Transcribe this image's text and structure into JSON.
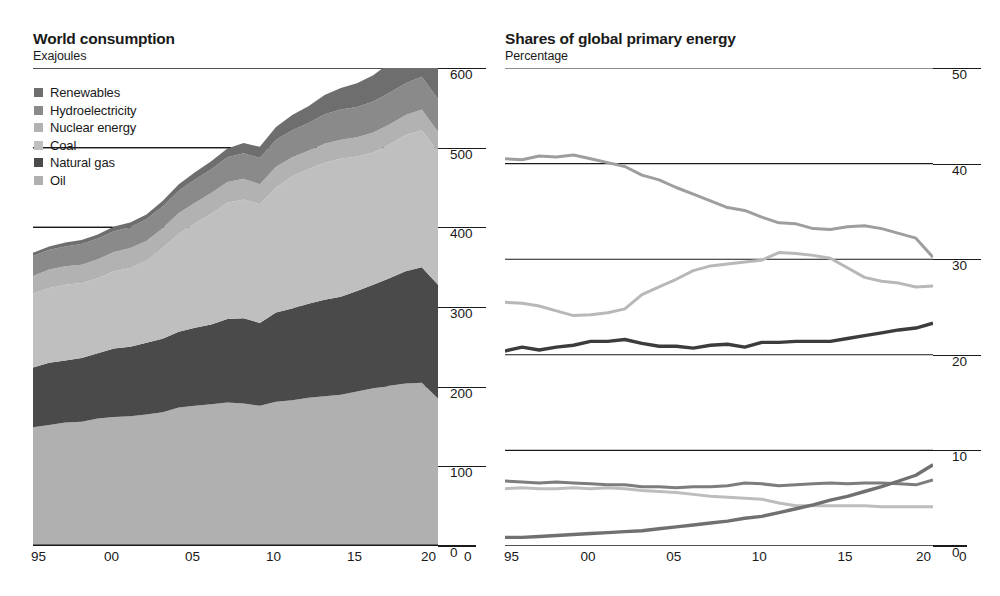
{
  "left_panel": {
    "title": "World consumption",
    "subtitle": "Exajoules",
    "legend": [
      {
        "label": "Renewables",
        "color": "#6e6e6e"
      },
      {
        "label": "Hydroelectricity",
        "color": "#8a8a8a"
      },
      {
        "label": "Nuclear energy",
        "color": "#b2b2b2"
      },
      {
        "label": "Coal",
        "color": "#bfbfbf"
      },
      {
        "label": "Natural gas",
        "color": "#4a4a4a"
      },
      {
        "label": "Oil",
        "color": "#b0b0b0"
      }
    ]
  },
  "right_panel": {
    "title": "Shares of global primary energy",
    "subtitle": "Percentage",
    "legend_col1": [
      {
        "label": "Oil",
        "color": "#b0b0b0"
      },
      {
        "label": "Coal",
        "color": "#c4c4c4"
      },
      {
        "label": "Natural gas",
        "color": "#3c3c3c"
      }
    ],
    "legend_col2": [
      {
        "label": "Hydroelectricity",
        "color": "#8a8a8a"
      },
      {
        "label": "Nuclear energy",
        "color": "#bdbdbd"
      },
      {
        "label": "Renewables",
        "color": "#6e6e6e"
      }
    ]
  },
  "chart_data": [
    {
      "id": "world-consumption",
      "type": "area",
      "title": "World consumption",
      "subtitle": "Exajoules",
      "xlabel": "",
      "ylabel": "Exajoules",
      "stacked": true,
      "grid": true,
      "legend_position": "top-left",
      "xlim": [
        1995,
        2020
      ],
      "ylim": [
        0,
        600
      ],
      "xticks": [
        1995,
        2000,
        2005,
        2010,
        2015,
        2020
      ],
      "xticklabels": [
        "95",
        "00",
        "05",
        "10",
        "15",
        "20"
      ],
      "yticks": [
        0,
        100,
        200,
        300,
        400,
        500,
        600
      ],
      "yticklabels": [
        "0",
        "100",
        "200",
        "300",
        "400",
        "500",
        "600"
      ],
      "x": [
        1995,
        1996,
        1997,
        1998,
        1999,
        2000,
        2001,
        2002,
        2003,
        2004,
        2005,
        2006,
        2007,
        2008,
        2009,
        2010,
        2011,
        2012,
        2013,
        2014,
        2015,
        2016,
        2017,
        2018,
        2019,
        2020
      ],
      "series": [
        {
          "name": "Oil",
          "color": "#b0b0b0",
          "values": [
            149,
            152,
            155,
            156,
            160,
            162,
            163,
            165,
            168,
            174,
            176,
            178,
            180,
            179,
            176,
            181,
            183,
            186,
            188,
            190,
            194,
            198,
            201,
            204,
            205,
            185
          ]
        },
        {
          "name": "Natural gas",
          "color": "#4a4a4a",
          "values": [
            75,
            78,
            78,
            80,
            82,
            86,
            87,
            90,
            92,
            95,
            98,
            100,
            105,
            107,
            104,
            112,
            115,
            118,
            121,
            123,
            126,
            130,
            135,
            141,
            145,
            143
          ]
        },
        {
          "name": "Coal",
          "color": "#bfbfbf",
          "values": [
            93,
            94,
            95,
            94,
            94,
            97,
            99,
            103,
            114,
            123,
            131,
            139,
            146,
            149,
            149,
            157,
            166,
            169,
            172,
            173,
            169,
            166,
            168,
            171,
            172,
            167
          ]
        },
        {
          "name": "Nuclear energy",
          "color": "#b2b2b2",
          "values": [
            22,
            23,
            23,
            23,
            24,
            24,
            25,
            25,
            25,
            26,
            26,
            26,
            26,
            26,
            25,
            26,
            24,
            23,
            24,
            24,
            24,
            25,
            25,
            25,
            26,
            25
          ]
        },
        {
          "name": "Hydroelectricity",
          "color": "#8a8a8a",
          "values": [
            25,
            25,
            25,
            26,
            26,
            26,
            26,
            27,
            27,
            28,
            29,
            30,
            31,
            32,
            33,
            34,
            34,
            35,
            37,
            38,
            38,
            39,
            40,
            40,
            41,
            41
          ]
        },
        {
          "name": "Renewables",
          "color": "#6e6e6e",
          "values": [
            4,
            4,
            5,
            5,
            5,
            6,
            6,
            6,
            7,
            8,
            9,
            10,
            11,
            13,
            14,
            16,
            19,
            21,
            24,
            27,
            30,
            33,
            37,
            42,
            47,
            52
          ]
        }
      ],
      "totals": [
        368,
        376,
        381,
        384,
        391,
        401,
        406,
        416,
        433,
        454,
        469,
        483,
        499,
        506,
        501,
        526,
        541,
        552,
        566,
        575,
        581,
        591,
        606,
        623,
        636,
        613
      ]
    },
    {
      "id": "shares-of-global-primary-energy",
      "type": "line",
      "title": "Shares of global primary energy",
      "subtitle": "Percentage",
      "xlabel": "",
      "ylabel": "Percentage",
      "grid": true,
      "legend_position": "top-center",
      "xlim": [
        1995,
        2020
      ],
      "ylim": [
        0,
        50
      ],
      "xticks": [
        1995,
        2000,
        2005,
        2010,
        2015,
        2020
      ],
      "xticklabels": [
        "95",
        "00",
        "05",
        "10",
        "15",
        "20"
      ],
      "yticks": [
        0,
        10,
        20,
        30,
        40,
        50
      ],
      "yticklabels": [
        "0",
        "10",
        "20",
        "30",
        "40",
        "50"
      ],
      "x": [
        1995,
        1996,
        1997,
        1998,
        1999,
        2000,
        2001,
        2002,
        2003,
        2004,
        2005,
        2006,
        2007,
        2008,
        2009,
        2010,
        2011,
        2012,
        2013,
        2014,
        2015,
        2016,
        2017,
        2018,
        2019,
        2020
      ],
      "series": [
        {
          "name": "Oil",
          "color": "#9e9e9e",
          "width": 3,
          "values": [
            40.5,
            40.4,
            40.8,
            40.7,
            40.9,
            40.5,
            40.1,
            39.7,
            38.8,
            38.3,
            37.5,
            36.8,
            36.1,
            35.4,
            35.1,
            34.4,
            33.8,
            33.7,
            33.2,
            33.1,
            33.4,
            33.5,
            33.2,
            32.7,
            32.2,
            30.2
          ]
        },
        {
          "name": "Coal",
          "color": "#b8b8b8",
          "width": 3,
          "values": [
            25.5,
            25.4,
            25.1,
            24.6,
            24.1,
            24.2,
            24.4,
            24.8,
            26.3,
            27.1,
            27.9,
            28.8,
            29.3,
            29.5,
            29.7,
            29.9,
            30.7,
            30.6,
            30.4,
            30.1,
            29.1,
            28.1,
            27.7,
            27.5,
            27.1,
            27.2
          ]
        },
        {
          "name": "Natural gas",
          "color": "#3c3c3c",
          "width": 3.4,
          "values": [
            20.4,
            20.8,
            20.5,
            20.8,
            21.0,
            21.4,
            21.4,
            21.6,
            21.2,
            20.9,
            20.9,
            20.7,
            21.0,
            21.1,
            20.8,
            21.3,
            21.3,
            21.4,
            21.4,
            21.4,
            21.7,
            22.0,
            22.3,
            22.6,
            22.8,
            23.3
          ]
        },
        {
          "name": "Hydroelectricity",
          "color": "#7d7d7d",
          "width": 3,
          "values": [
            6.8,
            6.7,
            6.6,
            6.7,
            6.6,
            6.5,
            6.4,
            6.4,
            6.2,
            6.2,
            6.1,
            6.2,
            6.2,
            6.3,
            6.6,
            6.5,
            6.3,
            6.4,
            6.5,
            6.6,
            6.5,
            6.6,
            6.6,
            6.5,
            6.4,
            6.9
          ]
        },
        {
          "name": "Nuclear energy",
          "color": "#bdbdbd",
          "width": 3,
          "values": [
            6.0,
            6.1,
            6.0,
            6.0,
            6.1,
            6.0,
            6.1,
            6.0,
            5.8,
            5.7,
            5.6,
            5.4,
            5.2,
            5.1,
            5.0,
            4.9,
            4.5,
            4.2,
            4.2,
            4.2,
            4.2,
            4.2,
            4.1,
            4.1,
            4.1,
            4.1
          ]
        },
        {
          "name": "Renewables",
          "color": "#707070",
          "width": 3.4,
          "values": [
            0.9,
            0.9,
            1.0,
            1.1,
            1.2,
            1.3,
            1.4,
            1.5,
            1.6,
            1.8,
            2.0,
            2.2,
            2.4,
            2.6,
            2.9,
            3.1,
            3.5,
            3.9,
            4.3,
            4.8,
            5.2,
            5.7,
            6.2,
            6.8,
            7.4,
            8.5
          ]
        }
      ]
    }
  ]
}
